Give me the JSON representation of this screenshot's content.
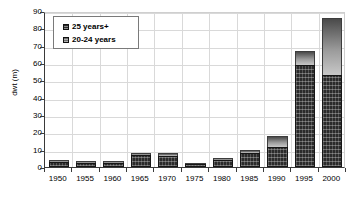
{
  "chart_data": {
    "type": "bar",
    "title": "",
    "subtitle": "",
    "xlabel": "",
    "ylabel": "dwt (m)",
    "ylim": [
      0,
      90
    ],
    "yticks": [
      0,
      10,
      20,
      30,
      40,
      50,
      60,
      70,
      80,
      90
    ],
    "grid": true,
    "stacked": true,
    "legend_position": "top-left",
    "categories": [
      "1950",
      "1955",
      "1960",
      "1965",
      "1970",
      "1975",
      "1980",
      "1985",
      "1990",
      "1995",
      "2000"
    ],
    "series": [
      {
        "name": "25 years+",
        "color": "#2b2b2b",
        "values": [
          3,
          2.5,
          2.5,
          7,
          6.5,
          1.5,
          4,
          8,
          11.5,
          59,
          53
        ]
      },
      {
        "name": "20-24 years",
        "color": "#9a9a9a",
        "values": [
          1,
          1,
          1,
          1,
          1.5,
          0.5,
          1,
          2,
          6.5,
          8,
          33
        ]
      }
    ],
    "totals": [
      4,
      3.5,
      3.5,
      8,
      8,
      2,
      5,
      10,
      18,
      67,
      86
    ]
  },
  "legend": {
    "items": [
      {
        "label": "25 years+",
        "swatch": "older"
      },
      {
        "label": "20-24 years",
        "swatch": "young"
      }
    ]
  }
}
